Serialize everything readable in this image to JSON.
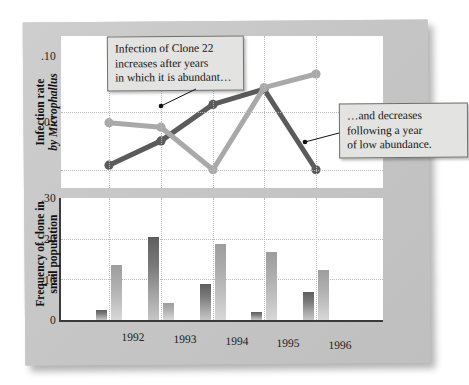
{
  "figure": {
    "background_color": "#c9c9c9",
    "panel_color": "#ffffff",
    "line_dark_color": "#5b5b5b",
    "line_light_color": "#a9a9a9",
    "bar_dark_color": "#6e6e6e",
    "bar_light_color": "#b2b2b2"
  },
  "annotations": [
    {
      "id": "callout-1",
      "text": "Infection of Clone 22\nincreases after years\nin which it is abundant…"
    },
    {
      "id": "callout-2",
      "text": "…and decreases\nfollowing a year\nof low abundance."
    }
  ],
  "chart_data": [
    {
      "type": "line",
      "id": "infection-rate-chart",
      "title": "",
      "xlabel": "",
      "ylabel": "Infection rate by Microphallus",
      "ylabel_plain": "Infection rate",
      "ylabel_italic": "by Microphallus",
      "categories": [
        "1992",
        "1993",
        "1994",
        "1995",
        "1996"
      ],
      "x": [
        1992,
        1993,
        1994,
        1995,
        1996
      ],
      "ylim": [
        0.0,
        0.1
      ],
      "yticks": [
        0.05,
        0.1
      ],
      "ytick_labels": [
        ".05",
        ".10"
      ],
      "grid": true,
      "legend": false,
      "series": [
        {
          "name": "Infection rate by Microphallus (Clone 22)",
          "color": "#5b5b5b",
          "values": [
            0.015,
            0.031,
            0.055,
            0.065,
            0.012
          ],
          "marker": "circle"
        },
        {
          "name": "Frequency of Clone 22 in snail population",
          "color": "#a9a9a9",
          "values": [
            0.043,
            0.04,
            0.012,
            0.066,
            0.075
          ],
          "marker": "circle"
        }
      ]
    },
    {
      "type": "bar",
      "id": "clone-frequency-chart",
      "title": "",
      "xlabel": "",
      "ylabel": "Frequency of clone in snail population",
      "ylabel_line1": "Frequency of clone in",
      "ylabel_line2": "snail population",
      "categories": [
        "1992",
        "1993",
        "1994",
        "1995",
        "1996"
      ],
      "ylim": [
        0.0,
        0.3
      ],
      "yticks": [
        0,
        0.1,
        0.2,
        0.3
      ],
      "ytick_labels": [
        "0",
        ".10",
        ".20",
        ".30"
      ],
      "grid": true,
      "legend": false,
      "series": [
        {
          "name": "Clone 22",
          "color": "#6e6e6e",
          "values": [
            0.025,
            0.205,
            0.088,
            0.02,
            0.07
          ]
        },
        {
          "name": "Other clone",
          "color": "#b2b2b2",
          "values": [
            0.135,
            0.043,
            0.187,
            0.168,
            0.122
          ]
        }
      ]
    }
  ]
}
